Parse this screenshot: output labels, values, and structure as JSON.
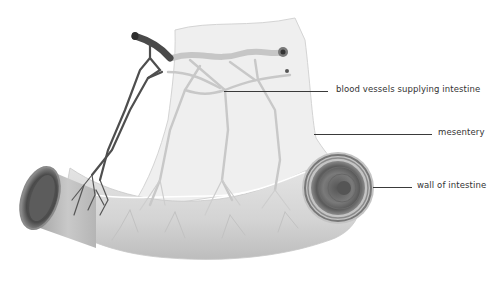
{
  "diagram": {
    "labels": [
      {
        "id": "blood-vessels",
        "text": "blood vessels supplying intestine"
      },
      {
        "id": "mesentery",
        "text": "mesentery"
      },
      {
        "id": "wall",
        "text": "wall of intestine"
      }
    ]
  },
  "colors": {
    "background": "#ffffff",
    "tissue_light": "#ececec",
    "tissue_mid": "#d8d8d8",
    "vessel_light": "#c4c4c4",
    "vessel_dark": "#4a4a4a",
    "label_text": "#333333",
    "leader_line": "#3a3a3a"
  }
}
